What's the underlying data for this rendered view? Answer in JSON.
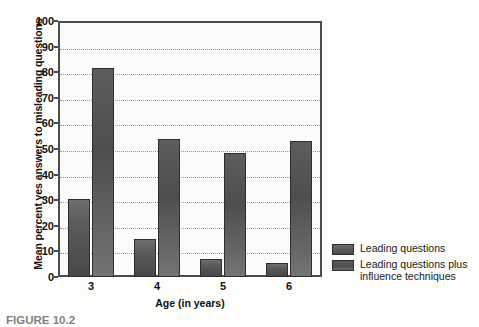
{
  "chart_data": {
    "type": "bar",
    "title": "",
    "xlabel": "Age (in years)",
    "ylabel": "Mean percent yes answers to misleading questions",
    "categories": [
      "3",
      "4",
      "5",
      "6"
    ],
    "ylim": [
      0,
      100
    ],
    "ytick_labels": [
      "0",
      "10",
      "20",
      "30",
      "40",
      "50",
      "60",
      "70",
      "80",
      "90",
      "100"
    ],
    "ytick_values": [
      0,
      10,
      20,
      30,
      40,
      50,
      60,
      70,
      80,
      90,
      100
    ],
    "grid": "horizontal-dotted",
    "legend_position": "right-bottom-outside",
    "series": [
      {
        "name": "Leading questions",
        "color": "#555555",
        "values": [
          30.5,
          15.0,
          7.0,
          5.5
        ]
      },
      {
        "name": "Leading questions plus influence techniques",
        "color": "#4f4f4f",
        "values": [
          81.5,
          54.0,
          48.5,
          53.0
        ]
      }
    ]
  },
  "legend": {
    "items": [
      {
        "label": "Leading questions",
        "swatch": "series-a"
      },
      {
        "label": "Leading questions plus influence techniques",
        "swatch": "series-b"
      }
    ]
  },
  "legend_lines": {
    "item1_line1": "Leading questions",
    "item2_line1": "Leading questions plus",
    "item2_line2": "influence techniques"
  },
  "caption": {
    "label": "FIGURE 10.2",
    "text": ""
  }
}
